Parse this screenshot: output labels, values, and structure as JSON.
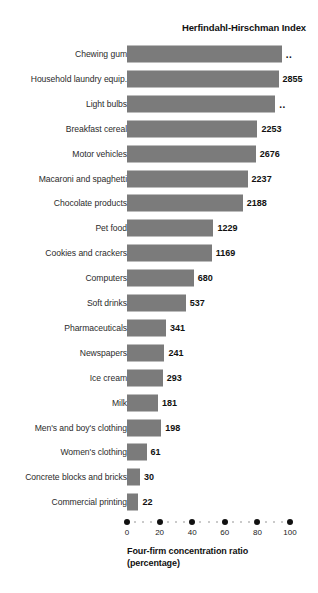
{
  "chart_data": {
    "type": "bar",
    "orientation": "horizontal",
    "title": "Herfindahl-Hirschman Index",
    "xlabel": "Four-firm concentration ratio",
    "xlabel_line2": "(percentage)",
    "ylabel": "",
    "xlim": [
      0,
      100
    ],
    "xticks": [
      0,
      20,
      40,
      60,
      80,
      100
    ],
    "xticklabels": [
      "0",
      "20",
      "40",
      "60",
      "80",
      "100"
    ],
    "grid": false,
    "legend": null,
    "bar_color": "#7b7b7b",
    "background": "#ffffff",
    "categories": [
      "Chewing gum",
      "Household laundry equip.",
      "Light bulbs",
      "Breakfast cereal",
      "Motor vehicles",
      "Macaroni and spaghetti",
      "Chocolate products",
      "Pet food",
      "Cookies and crackers",
      "Computers",
      "Soft drinks",
      "Pharmaceuticals",
      "Newspapers",
      "Ice cream",
      "Milk",
      "Men's and boy's clothing",
      "Women's clothing",
      "Concrete blocks and bricks",
      "Commercial printing"
    ],
    "values": [
      95,
      93,
      91,
      80,
      79,
      74,
      71,
      53,
      52,
      41,
      36,
      24,
      23,
      22,
      19,
      21,
      12,
      8,
      7
    ],
    "value_note": "values are the four-firm concentration ratio (percentage) read off the bar lengths",
    "data_labels": [
      "..",
      "2855",
      "..",
      "2253",
      "2676",
      "2237",
      "2188",
      "1229",
      "1169",
      "680",
      "537",
      "341",
      "241",
      "293",
      "181",
      "198",
      "61",
      "30",
      "22"
    ],
    "hhi": [
      null,
      2855,
      null,
      2253,
      2676,
      2237,
      2188,
      1229,
      1169,
      680,
      537,
      341,
      241,
      293,
      181,
      198,
      61,
      30,
      22
    ],
    "rows": [
      {
        "category": "Chewing gum",
        "ratio": 95,
        "label": ".."
      },
      {
        "category": "Household laundry equip.",
        "ratio": 93,
        "label": "2855"
      },
      {
        "category": "Light bulbs",
        "ratio": 91,
        "label": ".."
      },
      {
        "category": "Breakfast cereal",
        "ratio": 80,
        "label": "2253"
      },
      {
        "category": "Motor vehicles",
        "ratio": 79,
        "label": "2676"
      },
      {
        "category": "Macaroni and spaghetti",
        "ratio": 74,
        "label": "2237"
      },
      {
        "category": "Chocolate products",
        "ratio": 71,
        "label": "2188"
      },
      {
        "category": "Pet food",
        "ratio": 53,
        "label": "1229"
      },
      {
        "category": "Cookies and crackers",
        "ratio": 52,
        "label": "1169"
      },
      {
        "category": "Computers",
        "ratio": 41,
        "label": "680"
      },
      {
        "category": "Soft drinks",
        "ratio": 36,
        "label": "537"
      },
      {
        "category": "Pharmaceuticals",
        "ratio": 24,
        "label": "341"
      },
      {
        "category": "Newspapers",
        "ratio": 23,
        "label": "241"
      },
      {
        "category": "Ice cream",
        "ratio": 22,
        "label": "293"
      },
      {
        "category": "Milk",
        "ratio": 19,
        "label": "181"
      },
      {
        "category": "Men's and boy's clothing",
        "ratio": 21,
        "label": "198"
      },
      {
        "category": "Women's clothing",
        "ratio": 12,
        "label": "61"
      },
      {
        "category": "Concrete blocks and bricks",
        "ratio": 8,
        "label": "30"
      },
      {
        "category": "Commercial printing",
        "ratio": 7,
        "label": "22"
      }
    ]
  }
}
